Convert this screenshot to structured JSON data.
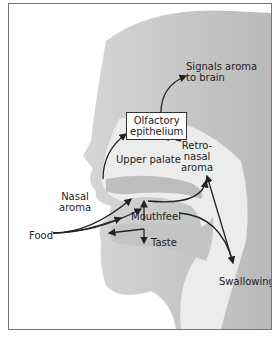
{
  "diagram": {
    "labels": {
      "signals": [
        "Signals aroma",
        "to brain"
      ],
      "olfactory": [
        "Olfactory",
        "epithelium"
      ],
      "retronasal": [
        "Retro-",
        "nasal",
        "aroma"
      ],
      "upper_palate": "Upper palate",
      "nasal_aroma": [
        "Nasal",
        "aroma"
      ],
      "mouthfeel": "Mouthfeel",
      "food": "Food",
      "taste": "Taste",
      "swallowing": "Swallowing"
    },
    "colors": {
      "head": "#c9c9c9",
      "cavity": "#ececec",
      "arrow": "#222222",
      "border": "#777777"
    }
  }
}
